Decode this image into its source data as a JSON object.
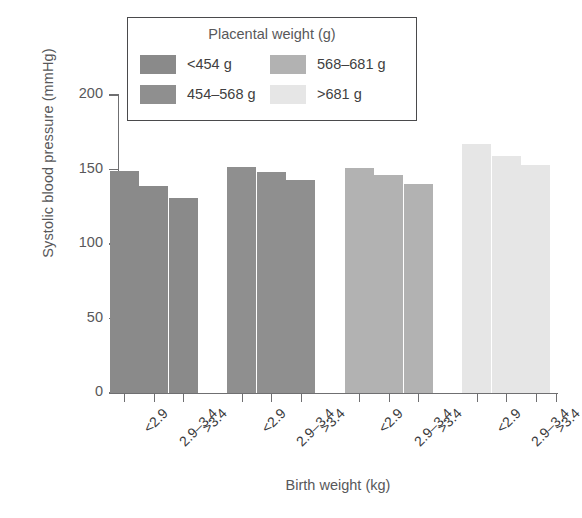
{
  "chart_data": {
    "type": "bar",
    "title": "",
    "xlabel": "Birth weight (kg)",
    "ylabel": "Systolic blood pressure (mmHg)",
    "ylim": [
      0,
      200
    ],
    "yticks": [
      0,
      50,
      100,
      150,
      200
    ],
    "ytick_labels": [
      "0",
      "50",
      "100",
      "150",
      "200"
    ],
    "grid": false,
    "legend_position": "top-inside",
    "legend_title": "Placental weight (g)",
    "categories": [
      "<2.9",
      "2.9–3.4",
      ">3.4"
    ],
    "group_labels": [
      "<454 g",
      "454–568 g",
      "568–681 g",
      ">681 g"
    ],
    "series": [
      {
        "name": "<454 g",
        "color": "#8a8a8a",
        "values": [
          149,
          139,
          131
        ]
      },
      {
        "name": "454–568 g",
        "color": "#8f8f8f",
        "values": [
          152,
          148,
          143
        ]
      },
      {
        "name": "568–681 g",
        "color": "#b2b2b2",
        "values": [
          151,
          146,
          140
        ]
      },
      {
        "name": ">681 g",
        "color": "#e6e6e6",
        "values": [
          167,
          159,
          153
        ]
      }
    ]
  },
  "legend": {
    "title": "Placental weight (g)",
    "items": [
      {
        "label": "<454 g",
        "color": "#8a8a8a"
      },
      {
        "label": "568–681 g",
        "color": "#b2b2b2"
      },
      {
        "label": "454–568 g",
        "color": "#8f8f8f"
      },
      {
        "label": ">681 g",
        "color": "#e6e6e6"
      }
    ]
  },
  "axes": {
    "y_title": "Systolic blood pressure (mmHg)",
    "x_title": "Birth weight (kg)",
    "y_tick_labels": [
      "200",
      "150",
      "100",
      "50",
      "0"
    ],
    "x_tick_labels": [
      "<2.9",
      "2.9–3.4",
      ">3.4",
      "<2.9",
      "2.9–3.4",
      ">3.4",
      "<2.9",
      "2.9–3.4",
      ">3.4",
      "<2.9",
      "2.9–3.4",
      ">3.4"
    ]
  }
}
